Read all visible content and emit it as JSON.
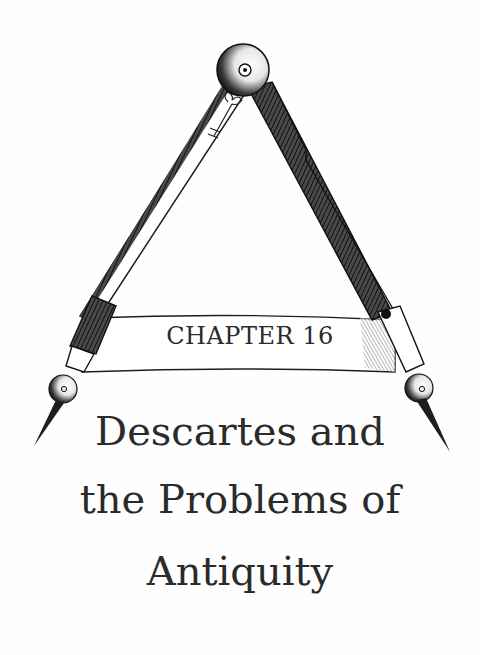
{
  "chapter": {
    "label": "CHAPTER 16",
    "title_lines": [
      "Descartes and",
      "the Problems of",
      "Antiquity"
    ]
  },
  "illustration": {
    "name": "drafting-compass-engraving",
    "ink_color": "#1e1e1e",
    "paper_color": "#fefefe"
  }
}
